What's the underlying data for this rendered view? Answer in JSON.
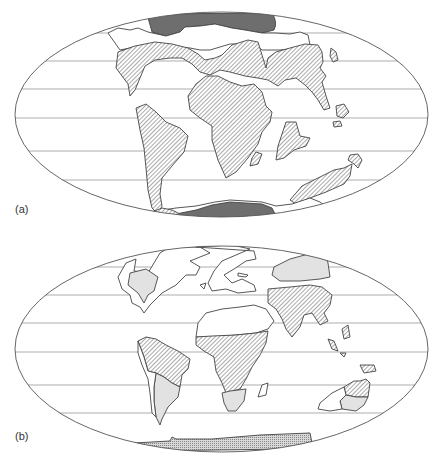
{
  "figure": {
    "panels": [
      {
        "id": "a",
        "label": "(a)",
        "projection": "elliptical (Mollweide-style)",
        "gridlines": 5,
        "legend_styles": {
          "hatched": "diagonal hatching",
          "dark_fill": "dark grey polar ice",
          "blank": "unshaded land"
        },
        "regions": [
          {
            "name": "northern-polar-ice",
            "style": "dark_fill"
          },
          {
            "name": "laurasia",
            "style": "hatched"
          },
          {
            "name": "africa",
            "style": "hatched"
          },
          {
            "name": "south-america",
            "style": "hatched"
          },
          {
            "name": "madagascar-india",
            "style": "hatched"
          },
          {
            "name": "antarctica-australia",
            "style": "hatched"
          },
          {
            "name": "southern-polar-ice",
            "style": "dark_fill"
          }
        ]
      },
      {
        "id": "b",
        "label": "(b)",
        "projection": "elliptical (Mollweide-style)",
        "gridlines": 5,
        "legend_styles": {
          "hatched": "diagonal hatching",
          "light_fill": "light grey shading",
          "stippled": "stippled Antarctic strip",
          "blank": "unshaded land"
        },
        "regions": [
          {
            "name": "north-america-interior",
            "style": "light_fill"
          },
          {
            "name": "siberia",
            "style": "light_fill"
          },
          {
            "name": "south-asia",
            "style": "hatched"
          },
          {
            "name": "northern-south-america",
            "style": "hatched"
          },
          {
            "name": "southern-south-america",
            "style": "light_fill"
          },
          {
            "name": "central-africa",
            "style": "hatched"
          },
          {
            "name": "southern-africa",
            "style": "light_fill"
          },
          {
            "name": "northern-australia",
            "style": "hatched"
          },
          {
            "name": "southern-australia",
            "style": "light_fill"
          },
          {
            "name": "antarctica",
            "style": "stippled"
          }
        ]
      }
    ],
    "colors": {
      "outline": "#444444",
      "grid": "#8a8a8a",
      "dark_fill": "#6e6e6e",
      "light_fill": "#e2e2e2",
      "hatch": "#555555",
      "background": "#ffffff"
    }
  }
}
